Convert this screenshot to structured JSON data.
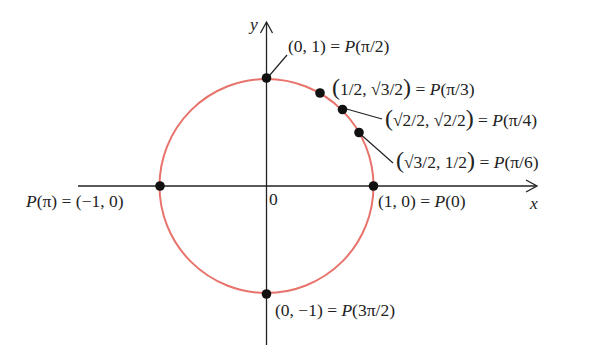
{
  "diagram": {
    "colors": {
      "circle": "#e8736c",
      "axes": "#222222",
      "points": "#111111",
      "text": "#222222"
    },
    "geometry": {
      "center": [
        266.5,
        186
      ],
      "radius": 107,
      "x_axis": {
        "from": 78,
        "to": 537,
        "y": 186
      },
      "y_axis": {
        "x": 266.5,
        "from": 345,
        "to": 22
      }
    },
    "axes": {
      "x_label": "x",
      "y_label": "y",
      "origin_label": "0"
    },
    "points": [
      {
        "id": "p0",
        "angle": "0",
        "coords": "(1, 0)",
        "label": "(1, 0) = P(0)"
      },
      {
        "id": "p_pi6",
        "angle": "π/6",
        "coords": "(√3/2, 1/2)",
        "label": "(√3/2, 1/2) = P(π/6)"
      },
      {
        "id": "p_pi4",
        "angle": "π/4",
        "coords": "(√2/2, √2/2)",
        "label": "(√2/2, √2/2) = P(π/4)"
      },
      {
        "id": "p_pi3",
        "angle": "π/3",
        "coords": "(1/2, √3/2)",
        "label": "(1/2, √3/2) = P(π/3)"
      },
      {
        "id": "p_pi2",
        "angle": "π/2",
        "coords": "(0, 1)",
        "label": "(0, 1) = P(π/2)"
      },
      {
        "id": "p_pi",
        "angle": "π",
        "coords": "(−1, 0)",
        "label": "P(π) = (−1, 0)"
      },
      {
        "id": "p_3pi2",
        "angle": "3π/2",
        "coords": "(0, −1)",
        "label": "(0, −1) = P(3π/2)"
      }
    ],
    "text": {
      "p0_lhs": "(1, 0) = ",
      "p0_P": "P",
      "p0_arg": "(0)",
      "p_pi2_lhs": "(0, 1) = ",
      "p_pi2_P": "P",
      "p_pi2_arg": "(π/2)",
      "p_pi3_open": "(",
      "p_pi3_inner": "1/2, √3/2",
      "p_pi3_close": ")",
      "p_pi3_eq": " = ",
      "p_pi3_P": "P",
      "p_pi3_arg": "(π/3)",
      "p_pi4_open": "(",
      "p_pi4_inner": "√2/2, √2/2",
      "p_pi4_close": ")",
      "p_pi4_eq": " = ",
      "p_pi4_P": "P",
      "p_pi4_arg": "(π/4)",
      "p_pi6_open": "(",
      "p_pi6_inner": "√3/2, 1/2",
      "p_pi6_close": ")",
      "p_pi6_eq": " = ",
      "p_pi6_P": "P",
      "p_pi6_arg": "(π/6)",
      "p_pi_P": "P",
      "p_pi_arg": "(π)",
      "p_pi_rhs": " = (−1, 0)",
      "p_3pi2_lhs": "(0, −1) = ",
      "p_3pi2_P": "P",
      "p_3pi2_arg": "(3π/2)"
    }
  }
}
